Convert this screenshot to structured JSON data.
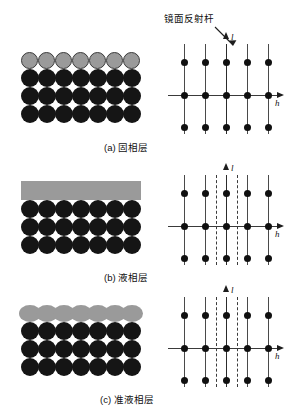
{
  "figure": {
    "annotation": {
      "label": "镜面反射杆",
      "leader_icon": "arrow-leader-icon"
    },
    "axes": {
      "horizontal_label": "h",
      "vertical_label": "l"
    },
    "panels": [
      {
        "id": "a",
        "caption": "(a) 固相层",
        "real_space": {
          "columns": 7,
          "dark_rows": 3,
          "surface_row_type": "discrete-gray-spheres",
          "surface_count": 7
        },
        "reciprocal_space": {
          "rod_columns": 5,
          "node_rows": 3,
          "solid_rods": 5,
          "dashed_rods": 0
        }
      },
      {
        "id": "b",
        "caption": "(b) 液相层",
        "real_space": {
          "columns": 7,
          "dark_rows": 3,
          "surface_row_type": "uniform-gray-slab",
          "surface_count": 1
        },
        "reciprocal_space": {
          "rod_columns": 5,
          "node_rows": 3,
          "solid_rods": 5,
          "dashed_rods": 2
        }
      },
      {
        "id": "c",
        "caption": "(c) 准液相层",
        "real_space": {
          "columns": 7,
          "dark_rows": 3,
          "surface_row_type": "merged-gray-blobs",
          "surface_count": 7
        },
        "reciprocal_space": {
          "rod_columns": 5,
          "node_rows": 3,
          "solid_rods": 5,
          "dashed_rods": 2
        }
      }
    ],
    "colors": {
      "bulk_atom": "#151515",
      "surface_atom": "#9a9a9a",
      "rod": "#4a4a4a",
      "node": "#101010",
      "background": "#ffffff"
    }
  }
}
